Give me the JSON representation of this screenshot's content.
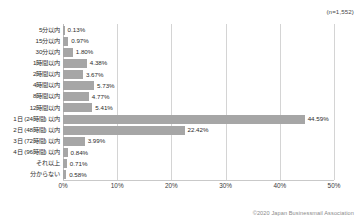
{
  "annotations": {
    "sample_size": "(n=1,552)",
    "footer": "©2020 Japan Businessmail Association"
  },
  "chart_data": {
    "type": "bar",
    "orientation": "horizontal",
    "title": "",
    "subtitle": "",
    "xlabel": "",
    "ylabel": "",
    "xlim": [
      0,
      50
    ],
    "grid": true,
    "legend": false,
    "bar_color": "#a6a6a6",
    "gridline_color": "#d4d4d4",
    "xticks": [
      "0%",
      "10%",
      "20%",
      "30%",
      "40%",
      "50%"
    ],
    "xtick_values": [
      0,
      10,
      20,
      30,
      40,
      50
    ],
    "categories": [
      "5分以内",
      "15分以内",
      "30分以内",
      "1時間以内",
      "2時間以内",
      "4時間以内",
      "8時間以内",
      "12時間以内",
      "1日 (24時間) 以内",
      "2日 (48時間) 以内",
      "3日 (72時間) 以内",
      "4日 (96時間) 以内",
      "それ以上",
      "分からない"
    ],
    "values": [
      0.13,
      0.97,
      1.8,
      4.38,
      3.67,
      5.73,
      4.77,
      5.41,
      44.59,
      22.42,
      3.99,
      0.84,
      0.71,
      0.58
    ],
    "value_labels": [
      "0.13%",
      "0.97%",
      "1.80%",
      "4.38%",
      "3.67%",
      "5.73%",
      "4.77%",
      "5.41%",
      "44.59%",
      "22.42%",
      "3.99%",
      "0.84%",
      "0.71%",
      "0.58%"
    ]
  }
}
